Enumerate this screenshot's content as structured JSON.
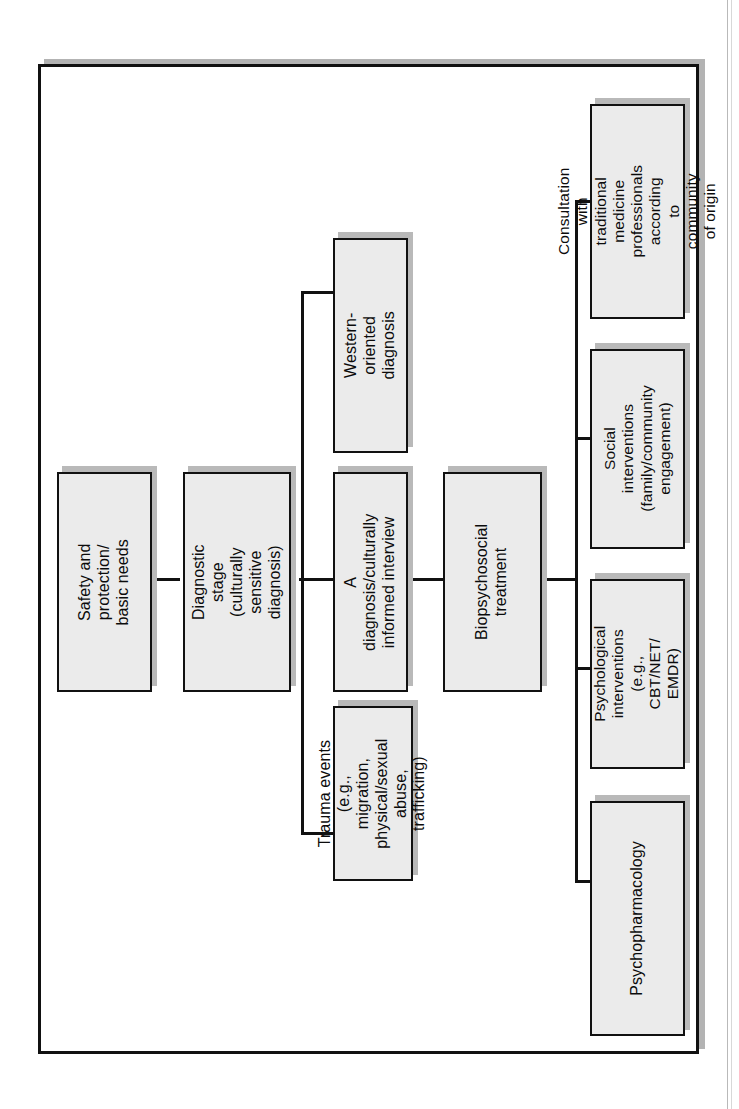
{
  "figure": {
    "orientation": "rotated-90-ccw",
    "nodes": [
      {
        "id": "safety",
        "label": "Safety and protection/\nbasic needs"
      },
      {
        "id": "diagnostic",
        "label": "Diagnostic stage\n(culturally sensitive\ndiagnosis)"
      },
      {
        "id": "western",
        "label": "Western-oriented\ndiagnosis"
      },
      {
        "id": "interview",
        "label": "A diagnosis/culturally\ninformed interview"
      },
      {
        "id": "trauma",
        "label": "Trauma events\n(e.g., migration,\nphysical/sexual abuse,\ntrafficking)"
      },
      {
        "id": "biopsy",
        "label": "Biopsychosocial\ntreatment"
      },
      {
        "id": "consultation",
        "label": "Consultation with\ntraditional medicine\nprofessionals according\nto community of origin"
      },
      {
        "id": "social",
        "label": "Social interventions\n(family/community\nengagement)"
      },
      {
        "id": "psychological",
        "label": "Psychological\ninterventions\n(e.g., CBT/NET/\nEMDR)"
      },
      {
        "id": "pharma",
        "label": "Psychopharmacology"
      }
    ],
    "edges": [
      {
        "from": "safety",
        "to": "diagnostic"
      },
      {
        "from": "diagnostic",
        "to": "western"
      },
      {
        "from": "diagnostic",
        "to": "interview"
      },
      {
        "from": "diagnostic",
        "to": "trauma"
      },
      {
        "from": "interview",
        "to": "biopsy"
      },
      {
        "from": "biopsy",
        "to": "consultation"
      },
      {
        "from": "biopsy",
        "to": "social"
      },
      {
        "from": "biopsy",
        "to": "psychological"
      },
      {
        "from": "biopsy",
        "to": "pharma"
      }
    ],
    "colors": {
      "node_fill": "#ebebeb",
      "node_border": "#111111",
      "shadow": "#b9b9b9",
      "frame": "#111111",
      "background": "#ffffff"
    }
  }
}
